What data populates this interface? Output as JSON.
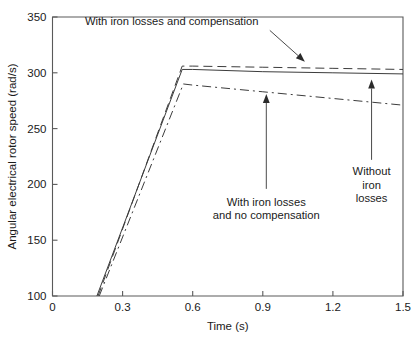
{
  "chart_data": {
    "type": "line",
    "title": "",
    "xlabel": "Time (s)",
    "ylabel": "Angular electrical rotor speed (rad/s)",
    "xlim": [
      0,
      1.5
    ],
    "ylim": [
      100,
      350
    ],
    "xticks": [
      0,
      0.3,
      0.6,
      0.9,
      1.2,
      1.5
    ],
    "xticklabels": [
      "0",
      "0.3",
      "0.6",
      "0.9",
      "1.2",
      "1.5"
    ],
    "yticks": [
      100,
      150,
      200,
      250,
      300,
      350
    ],
    "yticklabels": [
      "100",
      "150",
      "200",
      "250",
      "300",
      "350"
    ],
    "grid": false,
    "legend_position": "none",
    "series": [
      {
        "name": "Without iron losses",
        "style": "solid",
        "color": "#3c3c3c",
        "x": [
          0.19,
          0.555,
          0.6,
          0.9,
          1.2,
          1.5
        ],
        "y": [
          100,
          303,
          303,
          301,
          300,
          299
        ]
      },
      {
        "name": "With iron losses and compensation",
        "style": "dashed",
        "color": "#3c3c3c",
        "x": [
          0.195,
          0.555,
          0.6,
          0.9,
          1.2,
          1.5
        ],
        "y": [
          100,
          306,
          306,
          305,
          304,
          303
        ]
      },
      {
        "name": "With iron losses and no compensation",
        "style": "dash-dot",
        "color": "#3c3c3c",
        "x": [
          0.2,
          0.56,
          0.6,
          0.9,
          1.2,
          1.5
        ],
        "y": [
          100,
          290,
          289,
          283,
          277,
          271
        ]
      }
    ],
    "annotations": [
      {
        "name": "annotation-with-iron-losses-and-compensation",
        "lines": [
          "With iron losses and compensation"
        ],
        "text_x": 0.51,
        "text_y": 343,
        "arrow_from_x": 0.93,
        "arrow_from_y": 338,
        "arrow_to_x": 1.08,
        "arrow_to_y": 310
      },
      {
        "name": "annotation-with-iron-losses-and-no-compensation",
        "lines": [
          "With iron losses",
          "and no compensation"
        ],
        "text_x": 0.915,
        "text_y": 181,
        "arrow_from_x": 0.915,
        "arrow_from_y": 196,
        "arrow_to_x": 0.915,
        "arrow_to_y": 281
      },
      {
        "name": "annotation-without-iron-losses",
        "lines": [
          "Without",
          "iron",
          "losses"
        ],
        "text_x": 1.3655,
        "text_y": 208,
        "arrow_from_x": 1.3655,
        "arrow_from_y": 222,
        "arrow_to_x": 1.3655,
        "arrow_to_y": 294
      }
    ]
  },
  "colors": {
    "axis": "#5a5a5a",
    "line": "#3c3c3c",
    "text": "#1a1a1a",
    "background": "#ffffff"
  }
}
